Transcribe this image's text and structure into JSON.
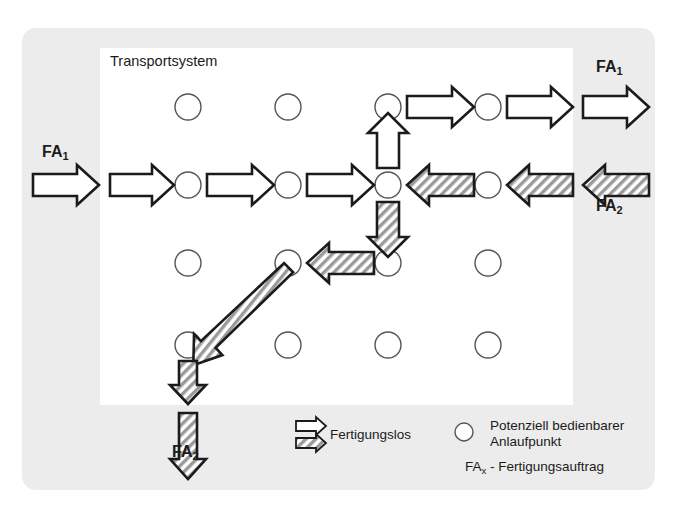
{
  "figure": {
    "width": 676,
    "height": 515,
    "background": "#ffffff",
    "panel_color": "#ececec",
    "inner_color": "#ffffff",
    "stroke_color": "#1b1b1b",
    "hatch_color": "#8c8c8c"
  },
  "title": "Transportsystem",
  "labels": {
    "fa1_left": "FA",
    "fa1_left_sub": "1",
    "fa1_right": "FA",
    "fa1_right_sub": "1",
    "fa2_right": "FA",
    "fa2_right_sub": "2",
    "fa2_bottom": "FA",
    "fa2_bottom_sub": "2"
  },
  "legend": {
    "fertigungslos": "Fertigungslos",
    "anlaufpunkt_line1": "Potenziell bedienbarer",
    "anlaufpunkt_line2": "Anlaufpunkt",
    "fax_prefix": "FA",
    "fax_sub": "x",
    "fax_suffix": " - Fertigungsauftrag"
  },
  "diagram_data": {
    "type": "diagram",
    "grid": {
      "columns_x": [
        188,
        288,
        388,
        488
      ],
      "rows_y": [
        107,
        185,
        263,
        345
      ],
      "node_radius": 13,
      "node_count": 16,
      "node_label": "Potenziell bedienbarer Anlaufpunkt"
    },
    "flows": [
      {
        "id": "fa1-entry-outer",
        "job": "FA1",
        "style": "white",
        "direction": "right",
        "from": [
          35,
          185
        ],
        "to": [
          98,
          185
        ]
      },
      {
        "id": "fa1-seg-1",
        "job": "FA1",
        "style": "white",
        "direction": "right",
        "from": [
          110,
          185
        ],
        "to": [
          173,
          185
        ]
      },
      {
        "id": "fa1-seg-2",
        "job": "FA1",
        "style": "white",
        "direction": "right",
        "from": [
          205,
          185
        ],
        "to": [
          273,
          185
        ]
      },
      {
        "id": "fa1-seg-3",
        "job": "FA1",
        "style": "white",
        "direction": "right",
        "from": [
          305,
          185
        ],
        "to": [
          373,
          185
        ]
      },
      {
        "id": "fa1-seg-up",
        "job": "FA1",
        "style": "white",
        "direction": "up",
        "from": [
          388,
          170
        ],
        "to": [
          388,
          123
        ]
      },
      {
        "id": "fa1-seg-4",
        "job": "FA1",
        "style": "white",
        "direction": "right",
        "from": [
          405,
          107
        ],
        "to": [
          473,
          107
        ]
      },
      {
        "id": "fa1-seg-5",
        "job": "FA1",
        "style": "white",
        "direction": "right",
        "from": [
          505,
          107
        ],
        "to": [
          572,
          107
        ]
      },
      {
        "id": "fa1-exit-outer",
        "job": "FA1",
        "style": "white",
        "direction": "right",
        "from": [
          582,
          107
        ],
        "to": [
          648,
          107
        ]
      },
      {
        "id": "fa2-entry-outer",
        "job": "FA2",
        "style": "hatched",
        "direction": "left",
        "from": [
          648,
          185
        ],
        "to": [
          582,
          185
        ]
      },
      {
        "id": "fa2-seg-1",
        "job": "FA2",
        "style": "hatched",
        "direction": "left",
        "from": [
          572,
          185
        ],
        "to": [
          505,
          185
        ]
      },
      {
        "id": "fa2-seg-2",
        "job": "FA2",
        "style": "hatched",
        "direction": "left",
        "from": [
          473,
          185
        ],
        "to": [
          405,
          185
        ]
      },
      {
        "id": "fa2-seg-down",
        "job": "FA2",
        "style": "hatched",
        "direction": "down",
        "from": [
          388,
          200
        ],
        "to": [
          388,
          248
        ]
      },
      {
        "id": "fa2-seg-3",
        "job": "FA2",
        "style": "hatched",
        "direction": "left",
        "from": [
          373,
          263
        ],
        "to": [
          305,
          263
        ]
      },
      {
        "id": "fa2-seg-diag",
        "job": "FA2",
        "style": "hatched",
        "direction": "down-left",
        "from": [
          280,
          274
        ],
        "to": [
          198,
          338
        ]
      },
      {
        "id": "fa2-seg-4",
        "job": "FA2",
        "style": "hatched",
        "direction": "down",
        "from": [
          188,
          360
        ],
        "to": [
          188,
          403
        ]
      },
      {
        "id": "fa2-exit-outer",
        "job": "FA2",
        "style": "hatched",
        "direction": "down",
        "from": [
          188,
          412
        ],
        "to": [
          188,
          480
        ]
      }
    ]
  }
}
